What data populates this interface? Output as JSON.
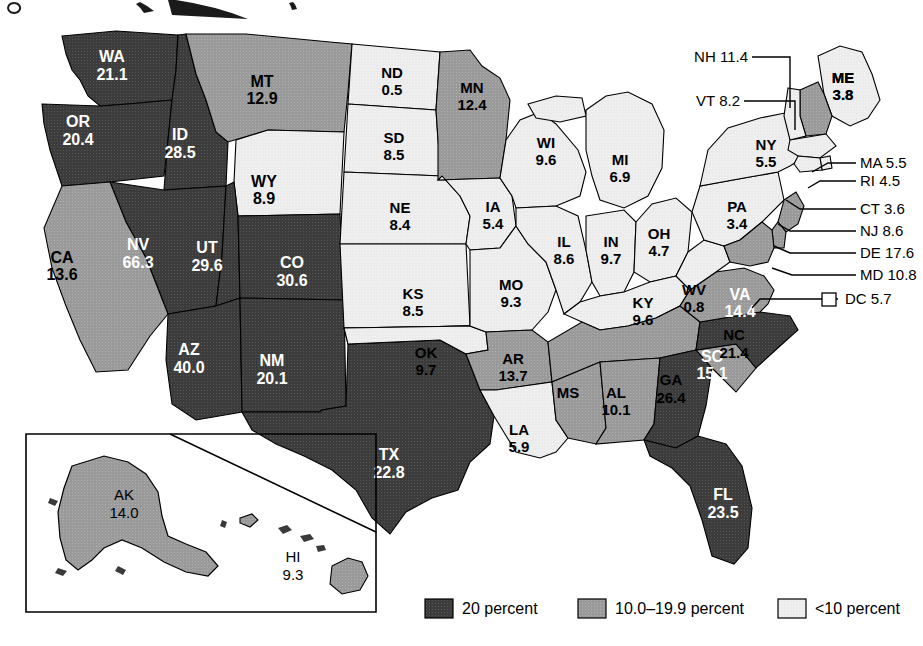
{
  "chart_data": {
    "type": "choropleth",
    "title": "",
    "unit": "percent",
    "legend": {
      "position": "bottom",
      "entries": [
        {
          "key": "dark",
          "label": "20 percent",
          "color": "#3c3c3c"
        },
        {
          "key": "mid",
          "label": "10.0–19.9 percent",
          "color": "#9a9a9a"
        },
        {
          "key": "light",
          "label": "<10 percent",
          "color": "#ececec"
        }
      ]
    },
    "inset": {
      "label_ak": "AK",
      "value_ak": "14.0",
      "label_hi": "HI",
      "value_hi": "9.3"
    },
    "values": {
      "WA": 21.1,
      "OR": 20.4,
      "ID": 28.5,
      "MT": 12.9,
      "WY": 8.9,
      "NV": 66.3,
      "UT": 29.6,
      "CO": 30.6,
      "CA": 13.6,
      "AZ": 40.0,
      "NM": 20.1,
      "TX": 22.8,
      "ND": 0.5,
      "SD": 8.5,
      "NE": 8.4,
      "KS": 8.5,
      "OK": 9.7,
      "MN": 12.4,
      "IA": 5.4,
      "MO": 9.3,
      "AR": 13.7,
      "LA": 5.9,
      "WI": 9.6,
      "IL": 8.6,
      "MI": 6.9,
      "IN": 9.7,
      "OH": 4.7,
      "KY": 9.6,
      "TN": 16.7,
      "MS": 10.5,
      "AL": 10.1,
      "GA": 26.4,
      "FL": 23.5,
      "SC": 15.1,
      "NC": 21.4,
      "VA": 14.4,
      "WV": 0.8,
      "PA": 3.4,
      "NY": 5.5,
      "ME": 3.8,
      "NH": 11.4,
      "VT": 8.2,
      "MA": 5.5,
      "RI": 4.5,
      "CT": 3.6,
      "NJ": 8.6,
      "DE": 17.6,
      "MD": 10.8,
      "DC": 5.7,
      "AK": 14.0,
      "HI": 9.3
    }
  },
  "states": [
    {
      "id": "WA",
      "label": "WA",
      "value": "21.1",
      "cls": "dark",
      "lx": 112,
      "ly": 62
    },
    {
      "id": "OR",
      "label": "OR",
      "value": "20.4",
      "cls": "dark",
      "lx": 78,
      "ly": 127
    },
    {
      "id": "ID",
      "label": "ID",
      "value": "28.5",
      "cls": "dark",
      "lx": 180,
      "ly": 140
    },
    {
      "id": "MT",
      "label": "MT",
      "value": "12.9",
      "cls": "mid",
      "lx": 262,
      "ly": 87
    },
    {
      "id": "WY",
      "label": "WY",
      "value": "8.9",
      "cls": "light",
      "lx": 264,
      "ly": 187
    },
    {
      "id": "NV",
      "label": "NV",
      "value": "66.3",
      "cls": "dark",
      "lx": 138,
      "ly": 250
    },
    {
      "id": "UT",
      "label": "UT",
      "value": "29.6",
      "cls": "dark",
      "lx": 207,
      "ly": 253
    },
    {
      "id": "CO",
      "label": "CO",
      "value": "30.6",
      "cls": "dark",
      "lx": 292,
      "ly": 268
    },
    {
      "id": "CA",
      "label": "CA",
      "value": "13.6",
      "cls": "mid",
      "lx": 62,
      "ly": 263
    },
    {
      "id": "AZ",
      "label": "AZ",
      "value": "40.0",
      "cls": "dark",
      "lx": 189,
      "ly": 355
    },
    {
      "id": "NM",
      "label": "NM",
      "value": "20.1",
      "cls": "dark",
      "lx": 272,
      "ly": 366
    },
    {
      "id": "TX",
      "label": "TX",
      "value": "22.8",
      "cls": "dark",
      "lx": 389,
      "ly": 460
    },
    {
      "id": "ND",
      "label": "ND",
      "value": "0.5",
      "cls": "light",
      "lx": 392,
      "ly": 78
    },
    {
      "id": "SD",
      "label": "SD",
      "value": "8.5",
      "cls": "light",
      "lx": 394,
      "ly": 143
    },
    {
      "id": "NE",
      "label": "NE",
      "value": "8.4",
      "cls": "light",
      "lx": 400,
      "ly": 213
    },
    {
      "id": "KS",
      "label": "KS",
      "value": "8.5",
      "cls": "light",
      "lx": 413,
      "ly": 299
    },
    {
      "id": "OK",
      "label": "OK",
      "value": "9.7",
      "cls": "light",
      "lx": 426,
      "ly": 358
    },
    {
      "id": "MN",
      "label": "MN",
      "value": "12.4",
      "cls": "mid",
      "lx": 472,
      "ly": 93
    },
    {
      "id": "IA",
      "label": "IA",
      "value": "5.4",
      "cls": "light",
      "lx": 493,
      "ly": 212
    },
    {
      "id": "MO",
      "label": "MO",
      "value": "9.3",
      "cls": "light",
      "lx": 511,
      "ly": 290
    },
    {
      "id": "AR",
      "label": "AR",
      "value": "13.7",
      "cls": "mid",
      "lx": 513,
      "ly": 364
    },
    {
      "id": "LA",
      "label": "LA",
      "value": "5.9",
      "cls": "light",
      "lx": 519,
      "ly": 435
    },
    {
      "id": "WI",
      "label": "WI",
      "value": "9.6",
      "cls": "light",
      "lx": 546,
      "ly": 148
    },
    {
      "id": "IL",
      "label": "IL",
      "value": "8.6",
      "cls": "light",
      "lx": 564,
      "ly": 247
    },
    {
      "id": "MI",
      "label": "MI",
      "value": "6.9",
      "cls": "light",
      "lx": 620,
      "ly": 165
    },
    {
      "id": "IN",
      "label": "IN",
      "value": "9.7",
      "cls": "light",
      "lx": 611,
      "ly": 247
    },
    {
      "id": "OH",
      "label": "OH",
      "value": "4.7",
      "cls": "light",
      "lx": 659,
      "ly": 239
    },
    {
      "id": "KY",
      "label": "KY",
      "value": "9.6",
      "cls": "light",
      "lx": 643,
      "ly": 308
    },
    {
      "id": "MS",
      "label": "MS",
      "value": "10.5",
      "cls": "mid",
      "lx": 568,
      "ly": 398
    },
    {
      "id": "AL",
      "label": "AL",
      "value": "10.1",
      "cls": "mid",
      "lx": 616,
      "ly": 398
    },
    {
      "id": "GA",
      "label": "GA",
      "value": "26.4",
      "cls": "dark",
      "lx": 671,
      "ly": 385
    },
    {
      "id": "FL",
      "label": "FL",
      "value": "23.5",
      "cls": "dark",
      "lx": 723,
      "ly": 500
    },
    {
      "id": "SC",
      "label": "SC",
      "value": "15.1",
      "cls": "mid",
      "lx": 712,
      "ly": 362
    },
    {
      "id": "NC",
      "label": "NC",
      "value": "21.4",
      "cls": "dark",
      "lx": 734,
      "ly": 340
    },
    {
      "id": "VA",
      "label": "VA",
      "value": "14.4",
      "cls": "mid",
      "lx": 740,
      "ly": 300
    },
    {
      "id": "WV",
      "label": "WV",
      "value": "0.8",
      "cls": "light",
      "lx": 694,
      "ly": 295
    },
    {
      "id": "PA",
      "label": "PA",
      "value": "3.4",
      "cls": "light",
      "lx": 737,
      "ly": 212
    },
    {
      "id": "NY",
      "label": "NY",
      "value": "5.5",
      "cls": "light",
      "lx": 766,
      "ly": 150
    },
    {
      "id": "ME",
      "label": "ME",
      "value": "3.8",
      "cls": "light",
      "lx": 843,
      "ly": 83
    }
  ],
  "tn": {
    "label": "TN 16.7",
    "cls": "mid",
    "lx": 611,
    "ly": 350
  },
  "callouts": [
    {
      "id": "NH",
      "text": "NH 11.4",
      "tx": 748,
      "ty": 62,
      "anchor": "end",
      "path": "M 752 57 L 790 57 L 790 108"
    },
    {
      "id": "VT",
      "text": "VT 8.2",
      "tx": 740,
      "ty": 106,
      "anchor": "end",
      "path": "M 744 101 L 795 101 L 795 130"
    },
    {
      "id": "MA",
      "text": "MA 5.5",
      "tx": 860,
      "ty": 168,
      "anchor": "start",
      "path": "M 856 163 L 828 163 L 812 172"
    },
    {
      "id": "RI",
      "text": "RI 4.5",
      "tx": 860,
      "ty": 186,
      "anchor": "start",
      "path": "M 856 181 L 820 181 L 808 188"
    },
    {
      "id": "CT",
      "text": "CT 3.6",
      "tx": 860,
      "ty": 214,
      "anchor": "start",
      "path": "M 856 209 L 800 209 L 786 200"
    },
    {
      "id": "NJ",
      "text": "NJ 8.6",
      "tx": 860,
      "ty": 236,
      "anchor": "start",
      "path": "M 856 231 L 790 231 L 778 224"
    },
    {
      "id": "DE",
      "text": "DE 17.6",
      "tx": 860,
      "ty": 258,
      "anchor": "start",
      "path": "M 856 253 L 790 253 L 774 246"
    },
    {
      "id": "MD",
      "text": "MD 10.8",
      "tx": 860,
      "ty": 280,
      "anchor": "start",
      "path": "M 856 275 L 792 275 L 772 268"
    },
    {
      "id": "DC",
      "text": "DC  5.7",
      "tx": 860,
      "ty": 304,
      "anchor": "start",
      "path": "M 838 299 L 760 299 L 752 308"
    }
  ],
  "dc_swatch": {
    "x": 822,
    "y": 293,
    "w": 14,
    "h": 13
  },
  "inset_labels": [
    {
      "id": "AK",
      "label": "AK",
      "value": "14.0",
      "lx": 124,
      "ly": 500
    },
    {
      "id": "HI",
      "label": "HI",
      "value": "9.3",
      "lx": 293,
      "ly": 562
    }
  ]
}
